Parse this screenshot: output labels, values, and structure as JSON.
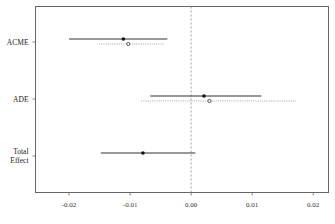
{
  "chart_data": {
    "type": "forest",
    "title": "",
    "xlabel": "",
    "ylabel": "",
    "xlim": [
      -0.0255,
      0.0225
    ],
    "xticks": [
      -0.02,
      -0.01,
      0.0,
      0.01,
      0.02
    ],
    "xtick_labels": [
      "-0.02",
      "-0.01",
      "0.00",
      "0.01",
      "0.02"
    ],
    "reference_line": 0.0,
    "grid": false,
    "categories": [
      {
        "label_lines": [
          "ACME"
        ]
      },
      {
        "label_lines": [
          "ADE"
        ]
      },
      {
        "label_lines": [
          "Total",
          "Effect"
        ]
      }
    ],
    "series": [
      {
        "name": "solid",
        "line_style": "solid",
        "marker": "filled-circle",
        "color": "#222222",
        "points": [
          {
            "category": "ACME",
            "estimate": -0.0111,
            "lower": -0.02,
            "upper": -0.0039
          },
          {
            "category": "ADE",
            "estimate": 0.0021,
            "lower": -0.0067,
            "upper": 0.0115
          },
          {
            "category": "Total Effect",
            "estimate": -0.0079,
            "lower": -0.0148,
            "upper": 0.0007
          }
        ]
      },
      {
        "name": "dotted",
        "line_style": "dotted",
        "marker": "open-circle",
        "color": "#888888",
        "points": [
          {
            "category": "ACME",
            "estimate": -0.0103,
            "lower": -0.0151,
            "upper": -0.0044
          },
          {
            "category": "ADE",
            "estimate": 0.003,
            "lower": -0.0082,
            "upper": 0.0172
          }
        ]
      }
    ]
  }
}
